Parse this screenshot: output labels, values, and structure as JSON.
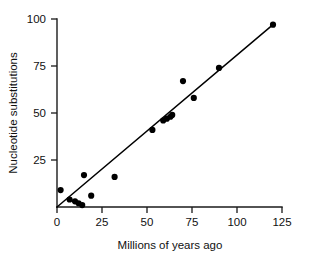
{
  "chart_data": {
    "type": "scatter",
    "title": "",
    "subtitle": "",
    "xlabel": "Millions of years ago",
    "ylabel": "Nucleotide substitutions",
    "xlim": [
      0,
      125
    ],
    "ylim": [
      0,
      100
    ],
    "xticks": [
      0,
      25,
      50,
      75,
      100,
      125
    ],
    "yticks": [
      0,
      25,
      50,
      75,
      100
    ],
    "xtick_labels": [
      "0",
      "25",
      "50",
      "75",
      "100",
      "125"
    ],
    "ytick_labels": [
      "25",
      "50",
      "75",
      "100"
    ],
    "grid": false,
    "legend": false,
    "legend_position": "none",
    "marker": "filled-circle",
    "marker_color": "#000000",
    "points": [
      {
        "x": 2,
        "y": 9
      },
      {
        "x": 7,
        "y": 4
      },
      {
        "x": 10,
        "y": 3
      },
      {
        "x": 12,
        "y": 2
      },
      {
        "x": 14,
        "y": 1
      },
      {
        "x": 15,
        "y": 17
      },
      {
        "x": 19,
        "y": 6
      },
      {
        "x": 32,
        "y": 16
      },
      {
        "x": 53,
        "y": 41
      },
      {
        "x": 59,
        "y": 46
      },
      {
        "x": 61,
        "y": 47
      },
      {
        "x": 63,
        "y": 48
      },
      {
        "x": 64,
        "y": 49
      },
      {
        "x": 70,
        "y": 67
      },
      {
        "x": 76,
        "y": 58
      },
      {
        "x": 90,
        "y": 74
      },
      {
        "x": 120,
        "y": 97
      }
    ],
    "fit_line": {
      "type": "linear-regression",
      "x_start": 0,
      "y_start": 0,
      "x_end": 120,
      "y_end": 97,
      "slope": 0.808,
      "intercept": 0
    }
  }
}
